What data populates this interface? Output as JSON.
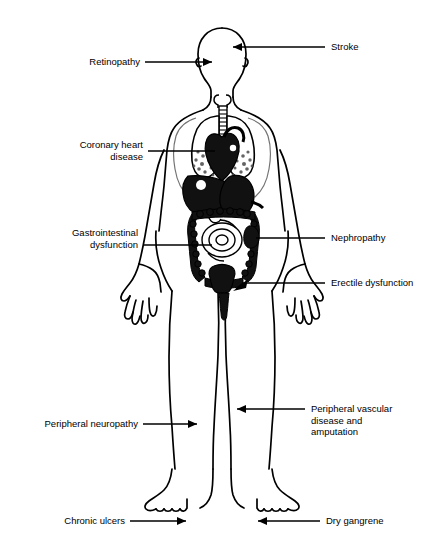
{
  "diagram": {
    "line_color": "#000000",
    "background_color": "#ffffff"
  },
  "labels": [
    {
      "id": "retinopathy",
      "text": "Retinopathy",
      "side": "left",
      "target": "eye"
    },
    {
      "id": "stroke",
      "text": "Stroke",
      "side": "right",
      "target": "brain"
    },
    {
      "id": "coronary",
      "text": "Coronary heart\ndisease",
      "side": "left",
      "target": "heart"
    },
    {
      "id": "gastrointestinal",
      "text": "Gastrointestinal\ndysfunction",
      "side": "left",
      "target": "intestines"
    },
    {
      "id": "nephropathy",
      "text": "Nephropathy",
      "side": "right",
      "target": "kidney"
    },
    {
      "id": "erectile",
      "text": "Erectile dysfunction",
      "side": "right",
      "target": "genitals"
    },
    {
      "id": "peripheral-neuro",
      "text": "Peripheral neuropathy",
      "side": "left",
      "target": "left-leg"
    },
    {
      "id": "peripheral-vascular",
      "text": "Peripheral vascular\ndisease and\namputation",
      "side": "right",
      "target": "right-leg"
    },
    {
      "id": "chronic-ulcers",
      "text": "Chronic ulcers",
      "side": "left",
      "target": "left-foot"
    },
    {
      "id": "dry-gangrene",
      "text": "Dry gangrene",
      "side": "right",
      "target": "right-foot"
    }
  ],
  "anatomy": {
    "organs": [
      "trachea",
      "lungs",
      "heart",
      "liver",
      "stomach",
      "colon",
      "small-intestine",
      "kidney",
      "bladder"
    ]
  }
}
